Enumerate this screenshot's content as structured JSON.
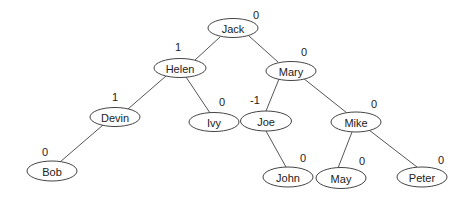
{
  "diagram": {
    "type": "binary-tree",
    "colors": {
      "edge": "#555555",
      "node_stroke": "#444444",
      "node_fill": "#ffffff",
      "text": "#222222"
    },
    "nodes": [
      {
        "id": "jack",
        "label": "Jack",
        "balance": "0",
        "cx": 233,
        "cy": 28,
        "bx": 256,
        "by": 15
      },
      {
        "id": "helen",
        "label": "Helen",
        "balance": "1",
        "cx": 180,
        "cy": 68,
        "bx": 178,
        "by": 47
      },
      {
        "id": "mary",
        "label": "Mary",
        "balance": "0",
        "cx": 291,
        "cy": 71,
        "bx": 304,
        "by": 52
      },
      {
        "id": "devin",
        "label": "Devin",
        "balance": "1",
        "cx": 115,
        "cy": 117,
        "bx": 115,
        "by": 97
      },
      {
        "id": "ivy",
        "label": "Ivy",
        "balance": "0",
        "cx": 214,
        "cy": 122,
        "bx": 222,
        "by": 102
      },
      {
        "id": "joe",
        "label": "Joe",
        "balance": "-1",
        "cx": 266,
        "cy": 121,
        "bx": 255,
        "by": 100
      },
      {
        "id": "mike",
        "label": "Mike",
        "balance": "0",
        "cx": 356,
        "cy": 122,
        "bx": 374,
        "by": 104
      },
      {
        "id": "bob",
        "label": "Bob",
        "balance": "0",
        "cx": 52,
        "cy": 171,
        "bx": 45,
        "by": 152
      },
      {
        "id": "john",
        "label": "John",
        "balance": "0",
        "cx": 288,
        "cy": 177,
        "bx": 303,
        "by": 158
      },
      {
        "id": "may",
        "label": "May",
        "balance": "0",
        "cx": 341,
        "cy": 178,
        "bx": 362,
        "by": 161
      },
      {
        "id": "peter",
        "label": "Peter",
        "balance": "0",
        "cx": 422,
        "cy": 177,
        "bx": 441,
        "by": 160
      }
    ],
    "edges": [
      {
        "from": "Jack",
        "to": "Helen",
        "x1": 220,
        "y1": 37,
        "x2": 195,
        "y2": 60
      },
      {
        "from": "Jack",
        "to": "Mary",
        "x1": 249,
        "y1": 36,
        "x2": 278,
        "y2": 62
      },
      {
        "from": "Helen",
        "to": "Devin",
        "x1": 166,
        "y1": 76,
        "x2": 128,
        "y2": 109
      },
      {
        "from": "Helen",
        "to": "Ivy",
        "x1": 186,
        "y1": 77,
        "x2": 210,
        "y2": 113
      },
      {
        "from": "Mary",
        "to": "Joe",
        "x1": 279,
        "y1": 79,
        "x2": 266,
        "y2": 111
      },
      {
        "from": "Mary",
        "to": "Mike",
        "x1": 303,
        "y1": 78,
        "x2": 347,
        "y2": 113
      },
      {
        "from": "Devin",
        "to": "Bob",
        "x1": 103,
        "y1": 125,
        "x2": 60,
        "y2": 162
      },
      {
        "from": "Joe",
        "to": "John",
        "x1": 266,
        "y1": 131,
        "x2": 286,
        "y2": 167
      },
      {
        "from": "Mike",
        "to": "May",
        "x1": 352,
        "y1": 132,
        "x2": 338,
        "y2": 168
      },
      {
        "from": "Mike",
        "to": "Peter",
        "x1": 369,
        "y1": 130,
        "x2": 417,
        "y2": 167
      }
    ]
  }
}
